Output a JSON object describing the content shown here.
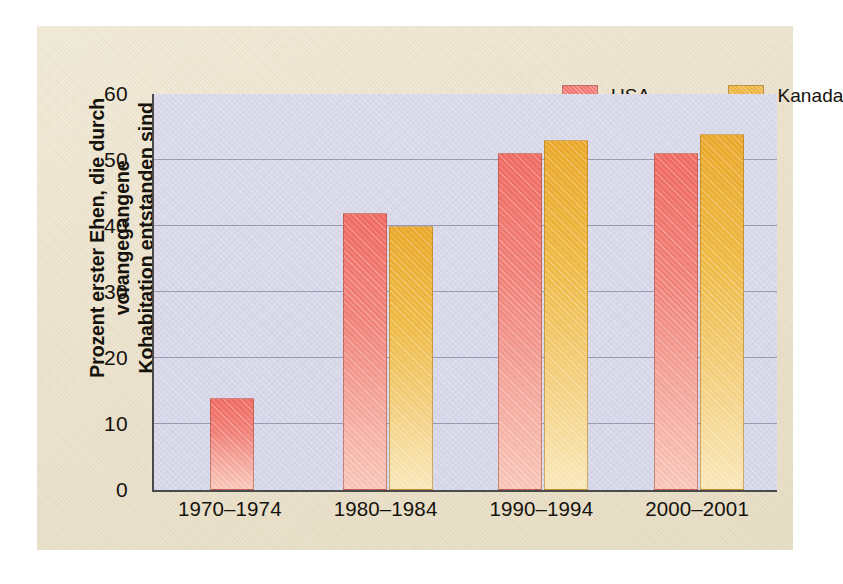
{
  "figure": {
    "background_color": "#ece3ce",
    "frame_color": "#ffffff"
  },
  "chart_data": {
    "type": "bar",
    "title": "",
    "subtitle": "",
    "xlabel": "",
    "ylabel": "Prozent erster Ehen, die durch vorangegangene Kohabitation entstanden sind",
    "ylabel_lines": [
      "Prozent erster Ehen, die durch vorangegangene",
      "Kohabitation entstanden sind"
    ],
    "categories": [
      "1970–1974",
      "1980–1984",
      "1990–1994",
      "2000–2001"
    ],
    "series": [
      {
        "name": "USA",
        "color": "#f0756d",
        "values": [
          14,
          42,
          51,
          51
        ]
      },
      {
        "name": "Kanada",
        "color": "#edb43c",
        "values": [
          null,
          40,
          53,
          54
        ]
      }
    ],
    "ylim": [
      0,
      60
    ],
    "yticks": [
      0,
      10,
      20,
      30,
      40,
      50,
      60
    ],
    "ytick_labels": [
      "0",
      "10",
      "20",
      "30",
      "40",
      "50",
      "60"
    ],
    "gridlines": [
      10,
      20,
      30,
      40,
      50
    ],
    "grid": true,
    "grid_color": "#9a9ab4",
    "plot_background_color": "#d9d9ea",
    "axis_color": "#4a4a4a",
    "legend_position": "top-right"
  },
  "legend": {
    "items": [
      {
        "label": "USA",
        "swatch_class": "usa",
        "icon": "legend-swatch-usa"
      },
      {
        "label": "Kanada",
        "swatch_class": "kanada",
        "icon": "legend-swatch-kanada"
      }
    ]
  }
}
